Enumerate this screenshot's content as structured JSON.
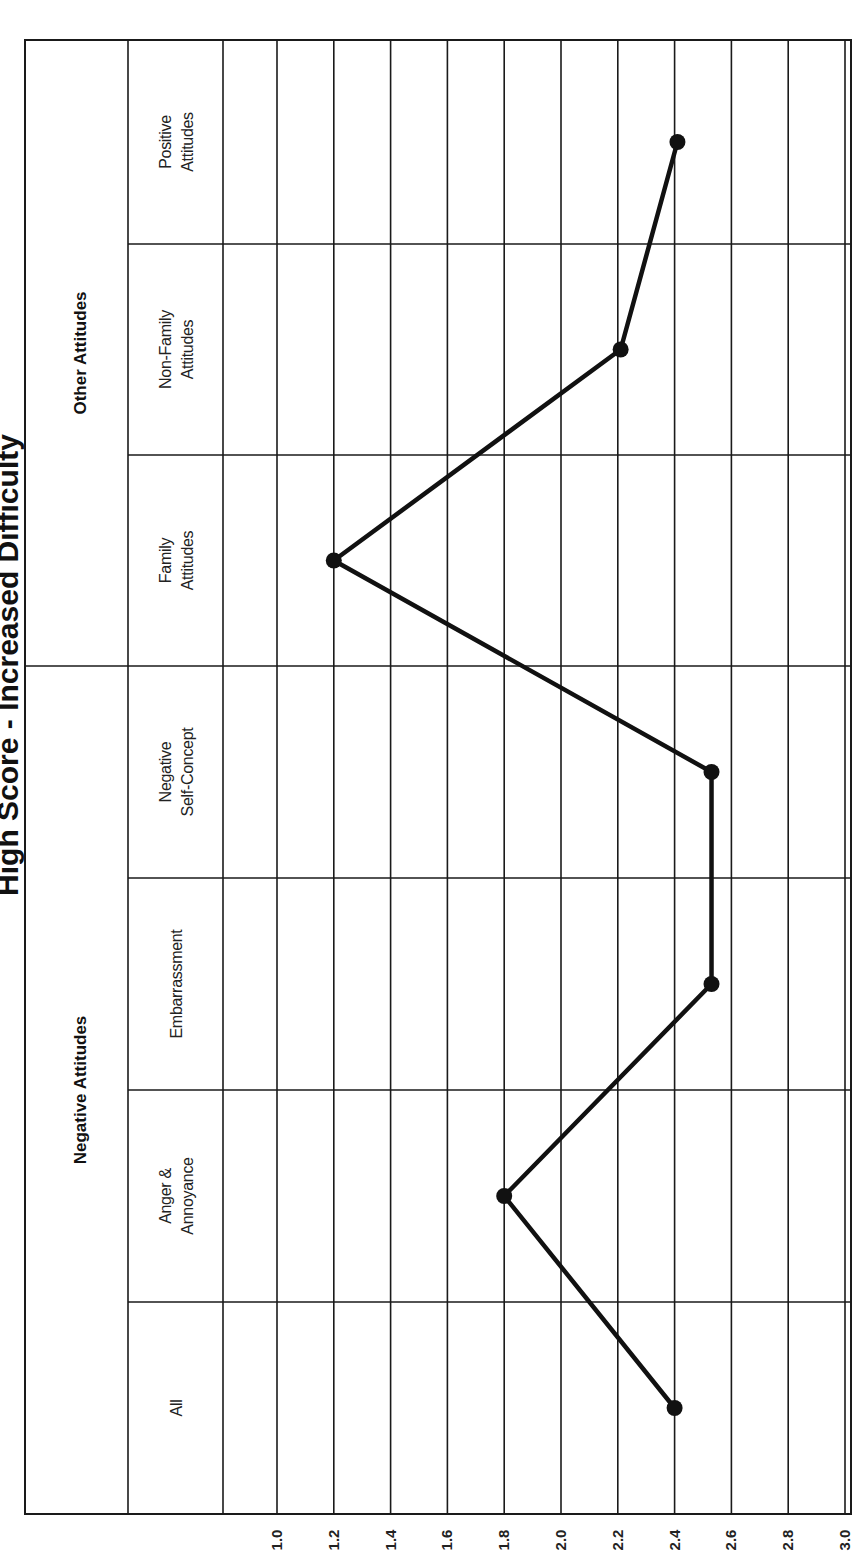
{
  "chart_data": {
    "type": "line",
    "orientation": "rotated-90-ccw",
    "title": "High Score - Increased Difficulty",
    "xlabel": "",
    "ylabel": "",
    "groups": [
      {
        "name": "Other Attitudes",
        "categories": [
          "Positive Attitudes",
          "Non-Family Attitudes",
          "Family Attitudes"
        ]
      },
      {
        "name": "Negative Attitudes",
        "categories": [
          "Negative Self-Concept",
          "Embarrassment",
          "Anger & Annoyance",
          "All"
        ]
      }
    ],
    "categories": [
      "Positive Attitudes",
      "Non-Family Attitudes",
      "Family Attitudes",
      "Negative Self-Concept",
      "Embarrassment",
      "Anger & Annoyance",
      "All"
    ],
    "category_lines": [
      [
        "Positive",
        "Attitudes"
      ],
      [
        "Non-Family",
        "Attitudes"
      ],
      [
        "Family",
        "Attitudes"
      ],
      [
        "Negative",
        "Self-Concept"
      ],
      [
        "Embarrassment"
      ],
      [
        "Anger  &",
        "Annoyance"
      ],
      [
        "All"
      ]
    ],
    "values": [
      2.41,
      2.21,
      1.2,
      2.53,
      2.53,
      1.8,
      2.4
    ],
    "value_ticks": [
      "1.0",
      "1.2",
      "1.4",
      "1.6",
      "1.8",
      "2.0",
      "2.2",
      "2.4",
      "2.6",
      "2.8",
      "3.0"
    ],
    "value_range": [
      0.8,
      3.0
    ],
    "grid": true,
    "legend": null,
    "colors": {
      "line": "#111111",
      "grid": "#1a1a1a",
      "background": "#ffffff"
    }
  }
}
